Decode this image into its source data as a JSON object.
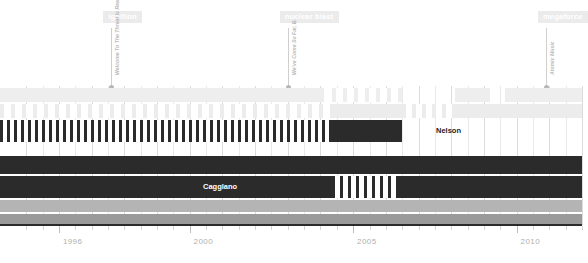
{
  "chart_data": {
    "type": "bar",
    "title": "",
    "subtitle": "",
    "xlabel": "",
    "ylabel": "",
    "grid": true,
    "legend_position": "none",
    "xlim": [
      1994.2,
      2012.0
    ],
    "x_tick_labels": [
      "1996",
      "2000",
      "2005",
      "2010"
    ],
    "x_tick_values": [
      1996,
      2000,
      2005,
      2010
    ],
    "x_minor_step": 0.5,
    "annotations": [
      {
        "badge": "ignition",
        "caption": "Welcome To The Threat Is Real",
        "x": 1997.6
      },
      {
        "badge": "nuclear blast",
        "caption": "We've Come So Far, B.",
        "x": 2003.0
      },
      {
        "badge": "megaforce",
        "caption": "Atomic Music",
        "x": 2010.9
      }
    ],
    "rows": [
      {
        "name": "row-1-light",
        "color": "#eeeeee",
        "label": "",
        "segments": [
          {
            "x0": 0,
            "x1": 324,
            "pattern": "solid"
          },
          {
            "x0": 332,
            "x1": 402,
            "pattern": "stripes",
            "period": 11,
            "bar": 4
          },
          {
            "x0": 455,
            "x1": 490,
            "pattern": "solid"
          },
          {
            "x0": 505,
            "x1": 582,
            "pattern": "solid"
          }
        ]
      },
      {
        "name": "row-2-light",
        "color": "#ececec",
        "label": "",
        "segments": [
          {
            "x0": 0,
            "x1": 332,
            "pattern": "stripes",
            "period": 11,
            "bar": 4
          },
          {
            "x0": 332,
            "x1": 402,
            "pattern": "solid"
          },
          {
            "x0": 402,
            "x1": 455,
            "pattern": "stripes",
            "period": 10,
            "bar": 4
          },
          {
            "x0": 455,
            "x1": 582,
            "pattern": "solid"
          }
        ]
      },
      {
        "name": "row-3-dark",
        "color": "#2b2b2b",
        "label": "Nelson",
        "label_x": 436,
        "label_style": "onlight",
        "segments": [
          {
            "x0": 0,
            "x1": 332,
            "pattern": "stripes",
            "period": 7,
            "bar": 3
          },
          {
            "x0": 332,
            "x1": 402,
            "pattern": "solid"
          }
        ]
      },
      {
        "name": "row-4-dark",
        "color": "#2b2b2b",
        "label": "",
        "segments": [
          {
            "x0": 0,
            "x1": 582,
            "pattern": "solid"
          }
        ]
      },
      {
        "name": "row-5-dark",
        "color": "#2b2b2b",
        "label": "Cagglano",
        "label_x": 203,
        "label_style": "ondark",
        "segments": [
          {
            "x0": 0,
            "x1": 332,
            "pattern": "solid"
          },
          {
            "x0": 332,
            "x1": 398,
            "pattern": "stripes",
            "period": 8,
            "bar": 3
          },
          {
            "x0": 398,
            "x1": 582,
            "pattern": "solid"
          }
        ]
      },
      {
        "name": "row-6-gray",
        "color": "#b4b4b4",
        "label": "",
        "segments": [
          {
            "x0": 0,
            "x1": 582,
            "pattern": "solid"
          }
        ]
      },
      {
        "name": "row-7-gray",
        "color": "#9a9a9a",
        "label": "",
        "segments": [
          {
            "x0": 0,
            "x1": 582,
            "pattern": "solid"
          }
        ]
      }
    ],
    "colors": {
      "dark": "#2b2b2b",
      "mid_gray": "#b4b4b4",
      "dark_gray": "#9a9a9a",
      "light": "#eeeeee",
      "badge_bg": "#ebebeb",
      "badge_text": "#ffffff",
      "axis": "#2b2b2b",
      "tick_label": "#b0b0b0",
      "grid": "#e9e9e9"
    }
  }
}
